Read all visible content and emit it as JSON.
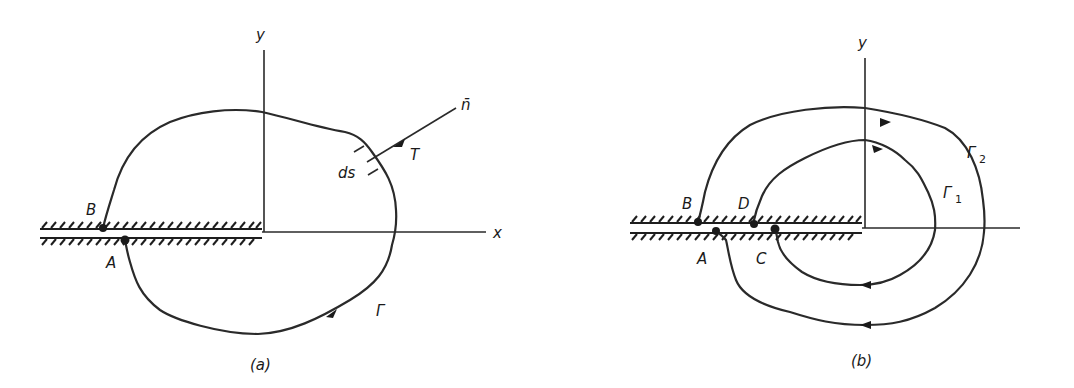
{
  "figures": [
    {
      "id": "a",
      "caption": "(a)",
      "axes": {
        "x_label": "x",
        "y_label": "y"
      },
      "points": {
        "B": "B",
        "A": "A"
      },
      "contour_label": "Γ",
      "element_label": "ds",
      "traction_label": "T",
      "normal_label": "n̄"
    },
    {
      "id": "b",
      "caption": "(b)",
      "axes": {
        "y_label": "y"
      },
      "points": {
        "B": "B",
        "D": "D",
        "A": "A",
        "C": "C"
      },
      "inner_contour_label": "Γ",
      "inner_contour_subscript": "1",
      "outer_contour_label": "Γ",
      "outer_contour_subscript": "2"
    }
  ],
  "colors": {
    "ink": "#1e1e1e",
    "background": "#ffffff"
  }
}
